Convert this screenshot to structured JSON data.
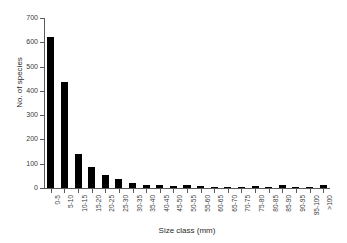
{
  "chart_data": {
    "type": "bar",
    "title": "",
    "xlabel": "Size class (mm)",
    "ylabel": "No. of species",
    "ylim": [
      0,
      700
    ],
    "yticks": [
      0,
      100,
      200,
      300,
      400,
      500,
      600,
      700
    ],
    "grid": false,
    "legend": null,
    "bar_color": "#000000",
    "background_color": "#ffffff",
    "axis_color": "#5a5a5a",
    "categories": [
      "0-5",
      "5-10",
      "10-15",
      "15-20",
      "20-25",
      "25-30",
      "30-35",
      "35-40",
      "40-45",
      "45-50",
      "50-55",
      "55-60",
      "60-65",
      "65-70",
      "70-75",
      "75-80",
      "80-85",
      "85-90",
      "90-95",
      "95-100",
      ">100"
    ],
    "values": [
      620,
      437,
      142,
      85,
      55,
      37,
      21,
      14,
      11,
      8,
      13,
      9,
      2,
      3,
      3,
      8,
      3,
      13,
      1,
      1,
      12
    ]
  }
}
